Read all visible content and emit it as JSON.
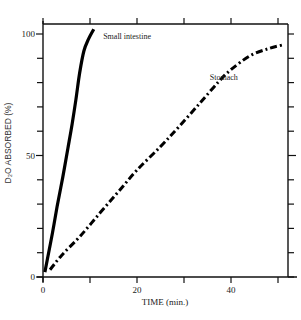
{
  "caption": "Figure showing D2O absorption",
  "chart_data": {
    "type": "line",
    "title": "",
    "xlabel": "TIME (min.)",
    "ylabel": "D₂O ABSORBED (%)",
    "xlim": [
      0,
      53
    ],
    "ylim": [
      0,
      102
    ],
    "x_ticks": [
      0,
      10,
      20,
      30,
      40,
      50
    ],
    "x_tick_labels": [
      "0",
      "",
      "20",
      "",
      "40",
      ""
    ],
    "y_ticks": [
      0,
      10,
      20,
      30,
      40,
      50,
      60,
      70,
      80,
      90,
      100
    ],
    "y_tick_labels": [
      "0",
      "",
      "",
      "",
      "",
      "50",
      "",
      "",
      "",
      "",
      "100"
    ],
    "grid": false,
    "series": [
      {
        "name": "Small intestine",
        "style": "solid",
        "x": [
          0.4,
          0.9,
          2.0,
          3.0,
          4.2,
          5.3,
          6.2,
          7.0,
          7.8,
          8.7,
          9.7,
          10.8
        ],
        "y": [
          2,
          7,
          18,
          29,
          41,
          53,
          63,
          73,
          84,
          93,
          98,
          102
        ]
      },
      {
        "name": "Stomach",
        "style": "dash-dot",
        "x": [
          1.5,
          4,
          8,
          12.1,
          16,
          20,
          24.9,
          29,
          33.4,
          37.2,
          39.8,
          44.0,
          48,
          51
        ],
        "y": [
          3,
          9,
          17,
          26.3,
          35,
          44,
          53.5,
          62,
          71.6,
          80,
          85,
          91,
          94,
          95.5
        ]
      }
    ],
    "annotations": [
      {
        "text": "Small intestine",
        "x": 12.8,
        "y": 98
      },
      {
        "text": "Stomach",
        "x": 35.5,
        "y": 81
      }
    ]
  }
}
